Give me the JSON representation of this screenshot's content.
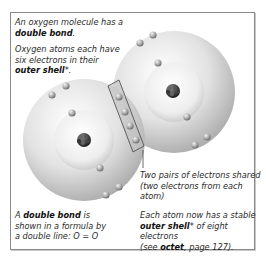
{
  "caption_top": {
    "line1": "An oxygen molecule has a",
    "line2_bold": "double bond",
    "line2_end": ".",
    "para2_line1": "Oxygen atoms each have",
    "para2_line2": "six electrons in their",
    "para2_bold": "outer shell",
    "para2_end": "*."
  },
  "caption_shared": {
    "line1": "Two pairs of electrons shared",
    "line2": "(two electrons from each atom)"
  },
  "caption_bottom_left": {
    "line1_start": "A ",
    "line1_bold": "double bond",
    "line1_end": " is",
    "line2": "shown in a formula by",
    "line3": "a double line: O = O"
  },
  "caption_bottom_right": {
    "line1": "Each atom now has a stable",
    "line2_bold": "outer shell",
    "line2_end": "* of eight electrons",
    "line3_start": "(see ",
    "line3_bold": "octet",
    "line3_end": ", page 127)."
  },
  "diagram": {
    "atoms": 2,
    "electrons_per_atom": 6,
    "shared_electrons": 4,
    "colors": {
      "shell": "#d8d8d8",
      "electron": "#9a9a9a",
      "nucleus": "#333333",
      "frame": "#8a8a8a"
    }
  }
}
